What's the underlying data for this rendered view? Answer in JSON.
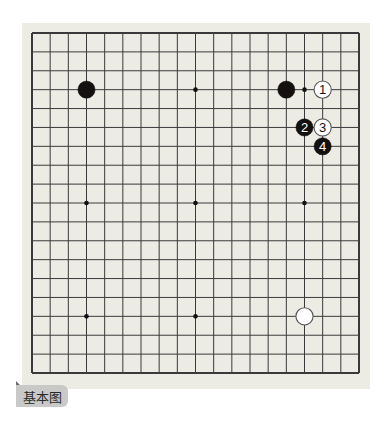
{
  "diagram": {
    "type": "go-board",
    "board_size": 19,
    "colors": {
      "board_background": "#ecebe4",
      "grid_line": "#3a3a3a",
      "black_stone": "#141010",
      "white_stone": "#ffffff",
      "caption_tab": "#c9c9c7"
    },
    "star_points": [
      [
        3,
        3
      ],
      [
        9,
        3
      ],
      [
        15,
        3
      ],
      [
        3,
        9
      ],
      [
        9,
        9
      ],
      [
        15,
        9
      ],
      [
        3,
        15
      ],
      [
        9,
        15
      ],
      [
        15,
        15
      ]
    ],
    "stones": [
      {
        "color": "black",
        "col": 3,
        "row": 3,
        "label": ""
      },
      {
        "color": "black",
        "col": 14,
        "row": 3,
        "label": ""
      },
      {
        "color": "white",
        "col": 16,
        "row": 3,
        "label": "1"
      },
      {
        "color": "black",
        "col": 15,
        "row": 5,
        "label": "2"
      },
      {
        "color": "white",
        "col": 16,
        "row": 5,
        "label": "3"
      },
      {
        "color": "black",
        "col": 16,
        "row": 6,
        "label": "4"
      },
      {
        "color": "white",
        "col": 15,
        "row": 15,
        "label": ""
      }
    ],
    "caption": "基本图"
  }
}
